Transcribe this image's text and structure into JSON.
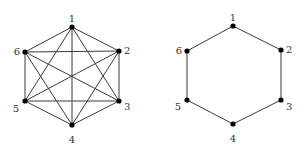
{
  "colors": {
    "edge": "#3a3a3a",
    "vertex": "#000000",
    "label": "#333333",
    "background": "#ffffff"
  },
  "graphs": [
    {
      "name": "complete-graph-k6",
      "vertices": [
        {
          "id": "1",
          "x": 72,
          "y": 27,
          "lx": 72,
          "ly": 19,
          "anchor": "middle"
        },
        {
          "id": "2",
          "x": 119,
          "y": 51,
          "lx": 124,
          "ly": 51,
          "anchor": "start"
        },
        {
          "id": "3",
          "x": 119,
          "y": 101,
          "lx": 124,
          "ly": 107,
          "anchor": "start"
        },
        {
          "id": "4",
          "x": 72,
          "y": 125,
          "lx": 72,
          "ly": 140,
          "anchor": "middle"
        },
        {
          "id": "5",
          "x": 25,
          "y": 101,
          "lx": 19,
          "ly": 109,
          "anchor": "end"
        },
        {
          "id": "6",
          "x": 25,
          "y": 52,
          "lx": 20,
          "ly": 52,
          "anchor": "end"
        }
      ],
      "edges": [
        [
          "1",
          "2"
        ],
        [
          "1",
          "3"
        ],
        [
          "1",
          "4"
        ],
        [
          "1",
          "5"
        ],
        [
          "1",
          "6"
        ],
        [
          "2",
          "3"
        ],
        [
          "2",
          "4"
        ],
        [
          "2",
          "5"
        ],
        [
          "2",
          "6"
        ],
        [
          "3",
          "4"
        ],
        [
          "3",
          "5"
        ],
        [
          "3",
          "6"
        ],
        [
          "4",
          "5"
        ],
        [
          "4",
          "6"
        ],
        [
          "5",
          "6"
        ]
      ]
    },
    {
      "name": "cycle-graph-c6",
      "vertices": [
        {
          "id": "1",
          "x": 233,
          "y": 26,
          "lx": 233,
          "ly": 18,
          "anchor": "middle"
        },
        {
          "id": "2",
          "x": 281,
          "y": 50,
          "lx": 286,
          "ly": 50,
          "anchor": "start"
        },
        {
          "id": "3",
          "x": 281,
          "y": 100,
          "lx": 286,
          "ly": 107,
          "anchor": "start"
        },
        {
          "id": "4",
          "x": 233,
          "y": 124,
          "lx": 233,
          "ly": 139,
          "anchor": "middle"
        },
        {
          "id": "5",
          "x": 187,
          "y": 100,
          "lx": 181,
          "ly": 107,
          "anchor": "end"
        },
        {
          "id": "6",
          "x": 187,
          "y": 51,
          "lx": 182,
          "ly": 51,
          "anchor": "end"
        }
      ],
      "edges": [
        [
          "1",
          "2"
        ],
        [
          "2",
          "3"
        ],
        [
          "3",
          "4"
        ],
        [
          "4",
          "5"
        ],
        [
          "5",
          "6"
        ],
        [
          "6",
          "1"
        ]
      ]
    }
  ]
}
